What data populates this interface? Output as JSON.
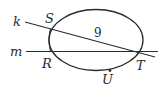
{
  "diagram": {
    "type": "circle-with-secant-lines",
    "lines": [
      {
        "name": "k",
        "label": "k"
      },
      {
        "name": "m",
        "label": "m"
      }
    ],
    "points": [
      {
        "name": "S",
        "label": "S"
      },
      {
        "name": "R",
        "label": "R"
      },
      {
        "name": "T",
        "label": "T"
      },
      {
        "name": "U",
        "label": "U"
      }
    ],
    "segment_ST_length": "9",
    "colors": {
      "stroke": "#2a2a2a",
      "background": "#ffffff"
    }
  }
}
